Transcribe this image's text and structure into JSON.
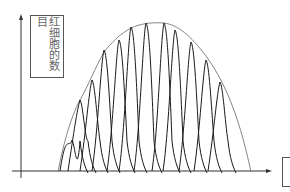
{
  "diagram": {
    "y_axis_label": "红细胞的数目",
    "x_axis_label": "",
    "colors": {
      "axis": "#333333",
      "curves": "#1a1a1a",
      "envelope": "#777777",
      "label_text": "#666666"
    }
  },
  "chart_data": {
    "type": "line",
    "title": "",
    "ylabel": "红细胞的数目",
    "xlabel": "",
    "grid": false,
    "legend": "none",
    "envelope": {
      "x": [
        60,
        80,
        92,
        104,
        119,
        131,
        146,
        164,
        175,
        191,
        206,
        220,
        245
      ],
      "y": [
        175,
        100,
        80,
        50,
        40,
        27,
        23,
        23,
        30,
        42,
        60,
        82,
        176
      ]
    },
    "peaks": [
      {
        "x": 72,
        "height_px": 140
      },
      {
        "x": 80,
        "height_px": 100
      },
      {
        "x": 92,
        "height_px": 80
      },
      {
        "x": 104,
        "height_px": 50
      },
      {
        "x": 119,
        "height_px": 40
      },
      {
        "x": 131,
        "height_px": 27
      },
      {
        "x": 146,
        "height_px": 23
      },
      {
        "x": 164,
        "height_px": 23
      },
      {
        "x": 175,
        "height_px": 30
      },
      {
        "x": 191,
        "height_px": 42
      },
      {
        "x": 206,
        "height_px": 60
      },
      {
        "x": 220,
        "height_px": 82
      }
    ]
  }
}
